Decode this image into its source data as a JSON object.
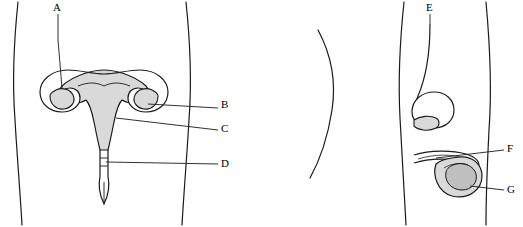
{
  "figure": {
    "title": "",
    "type": "anatomy-diagram",
    "panels": [
      {
        "name": "female-reproductive-anatomy",
        "labels": [
          {
            "id": "A",
            "text": "A",
            "x": 56,
            "y": 5
          },
          {
            "id": "B",
            "text": "B",
            "x": 223,
            "y": 104
          },
          {
            "id": "C",
            "text": "C",
            "x": 223,
            "y": 126
          },
          {
            "id": "D",
            "text": "D",
            "x": 223,
            "y": 160
          }
        ]
      },
      {
        "name": "male-reproductive-anatomy",
        "labels": [
          {
            "id": "E",
            "text": "E",
            "x": 428,
            "y": 5
          },
          {
            "id": "F",
            "text": "F",
            "x": 508,
            "y": 143
          },
          {
            "id": "G",
            "text": "G",
            "x": 508,
            "y": 184
          }
        ]
      }
    ]
  },
  "colors": {
    "outline": "#1a1a1a",
    "organ_fill": "#d9d9d9",
    "light_fill": "#f2f2f2",
    "background": "#ffffff"
  }
}
